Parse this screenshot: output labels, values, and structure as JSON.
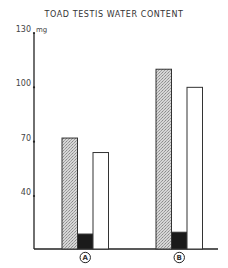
{
  "chart_data": {
    "type": "bar",
    "title": "TOAD TESTIS WATER CONTENT",
    "xlabel": "",
    "ylabel": "mg",
    "yunit": "mg",
    "ylim": [
      10,
      130
    ],
    "yticks": [
      40,
      70,
      100,
      130
    ],
    "ytick_labels": [
      "40",
      "70",
      "100",
      "130"
    ],
    "grid": false,
    "legend": null,
    "categories": [
      "A",
      "B"
    ],
    "series": [
      {
        "name": "stippled",
        "fill": "#c8c8c8",
        "pattern": "stipple",
        "values": [
          72,
          110
        ]
      },
      {
        "name": "black",
        "fill": "#1a1a1a",
        "pattern": "solid",
        "values": [
          19,
          20
        ]
      },
      {
        "name": "white",
        "fill": "#ffffff",
        "pattern": "outline",
        "values": [
          64,
          100
        ]
      }
    ]
  },
  "labels": {
    "title": "TOAD TESTIS WATER CONTENT",
    "unit": "mg",
    "categories": [
      "A",
      "B"
    ]
  }
}
